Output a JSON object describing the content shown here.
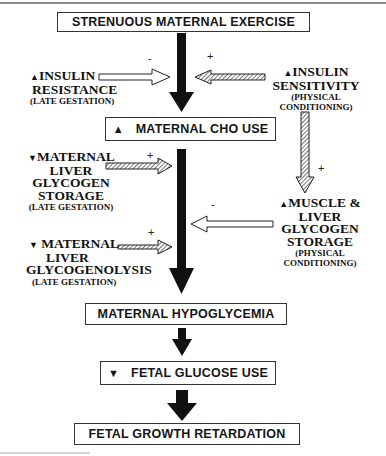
{
  "diagram": {
    "title_box": "STRENUOUS MATERNAL EXERCISE",
    "cho_box": {
      "glyph": "▲",
      "text": "MATERNAL CHO USE"
    },
    "hypoglycemia_box": "MATERNAL HYPOGLYCEMIA",
    "fetal_glucose_box": {
      "glyph": "▼",
      "text": "FETAL GLUCOSE USE"
    },
    "fetal_growth_box": "FETAL GROWTH RETARDATION",
    "left_factors": [
      {
        "glyph": "▲",
        "lines": [
          "INSULIN",
          "RESISTANCE"
        ],
        "note": "(LATE GESTATION)",
        "sign": "-"
      },
      {
        "glyph": "▼",
        "lines": [
          "MATERNAL",
          "LIVER",
          "GLYCOGEN",
          "STORAGE"
        ],
        "note": "(LATE GESTATION)",
        "sign": "+"
      },
      {
        "glyph": "▼",
        "lines": [
          "MATERNAL",
          "LIVER",
          "GLYCOGENOLYSIS"
        ],
        "note": "(LATE GESTATION)",
        "sign": "+"
      }
    ],
    "right_factors": [
      {
        "glyph": "▲",
        "lines": [
          "INSULIN",
          "SENSITIVITY"
        ],
        "note_lines": [
          "(PHYSICAL",
          "CONDITIONING)"
        ],
        "sign": "+"
      },
      {
        "glyph": "▲",
        "lines": [
          "MUSCLE &",
          "LIVER",
          "GLYCOGEN",
          "STORAGE"
        ],
        "note_lines": [
          "(PHYSICAL",
          "CONDITIONING)"
        ],
        "sign": "-"
      }
    ],
    "link_sign": "+",
    "colors": {
      "arrow_solid": "#111111",
      "box_border": "#333333",
      "hatch": "#555555",
      "background": "#ffffff"
    }
  }
}
